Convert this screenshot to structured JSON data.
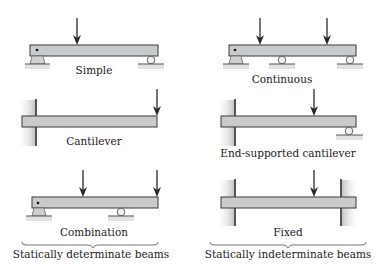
{
  "diagram": {
    "colors": {
      "beam_fill": "#c9cacb",
      "beam_stroke": "#3a3a3a",
      "support": "#cfcfcf",
      "arrow": "#2a2a2a",
      "text": "#222222"
    },
    "beams": [
      {
        "id": "simple",
        "label": "Simple",
        "supports": [
          "pin",
          "roller"
        ],
        "loads": 1
      },
      {
        "id": "continuous",
        "label": "Continuous",
        "supports": [
          "pin",
          "roller",
          "roller"
        ],
        "loads": 2
      },
      {
        "id": "cantilever",
        "label": "Cantilever",
        "supports": [
          "fixed-wall"
        ],
        "loads": 1
      },
      {
        "id": "end-supported-cantilever",
        "label": "End-supported cantilever",
        "supports": [
          "fixed-wall",
          "roller"
        ],
        "loads": 1
      },
      {
        "id": "combination",
        "label": "Combination",
        "supports": [
          "pin",
          "roller"
        ],
        "loads": 2
      },
      {
        "id": "fixed",
        "label": "Fixed",
        "supports": [
          "fixed-wall",
          "fixed-wall"
        ],
        "loads": 1
      }
    ],
    "groups": [
      {
        "label": "Statically determinate beams",
        "members": [
          "simple",
          "cantilever",
          "combination"
        ]
      },
      {
        "label": "Statically indeterminate beams",
        "members": [
          "continuous",
          "end-supported-cantilever",
          "fixed"
        ]
      }
    ]
  }
}
